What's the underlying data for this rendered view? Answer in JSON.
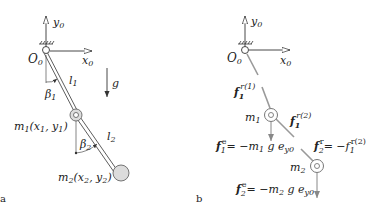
{
  "panels": [
    {
      "id": "a",
      "label": "a",
      "title": "Double pendulum geometry",
      "origin": "O",
      "origin_sub": "0",
      "axes": {
        "x": "x",
        "x_sub": "0",
        "y": "y",
        "y_sub": "0"
      },
      "gravity": "g",
      "links": [
        {
          "name": "l",
          "sub": "1"
        },
        {
          "name": "l",
          "sub": "2"
        }
      ],
      "angles": [
        {
          "name": "β",
          "sub": "1"
        },
        {
          "name": "β",
          "sub": "2"
        }
      ],
      "masses": [
        {
          "name": "m",
          "sub": "1",
          "coords": "(x",
          "c1": "1",
          "sep": ", y",
          "c2": "1",
          "close": ")"
        },
        {
          "name": "m",
          "sub": "2",
          "coords": "(x",
          "c1": "2",
          "sep": ", y",
          "c2": "2",
          "close": ")"
        }
      ]
    },
    {
      "id": "b",
      "label": "b",
      "title": "Free body diagram with forces",
      "origin": "O",
      "origin_sub": "0",
      "axes": {
        "x": "x",
        "x_sub": "0",
        "y": "y",
        "y_sub": "0"
      },
      "masses": [
        {
          "name": "m",
          "sub": "1"
        },
        {
          "name": "m",
          "sub": "2"
        }
      ],
      "forces": {
        "f1_r1": {
          "base": "f",
          "sub": "1",
          "sup": "r(1)"
        },
        "f1_r2": {
          "base": "f",
          "sub": "1",
          "sup": "r(2)"
        },
        "f1_e": {
          "lhs": "f",
          "sub": "1",
          "sup": "e",
          "rhs": "= −m",
          "msub": "1",
          "tail": " g e",
          "esub": "y0"
        },
        "f2_r": {
          "lhs": "f",
          "sub": "2",
          "sup": "r",
          "rhs": "= −f",
          "rsub": "1",
          "rsup": "r(2)"
        },
        "f2_e": {
          "lhs": "f",
          "sub": "2",
          "sup": "e",
          "rhs": "= −m",
          "msub": "2",
          "tail": " g e",
          "esub": "y0"
        }
      }
    }
  ],
  "colors": {
    "line": "#333333",
    "rod": "#999999",
    "mass_fill": "#dcdcdc",
    "arrow": "#888888"
  }
}
